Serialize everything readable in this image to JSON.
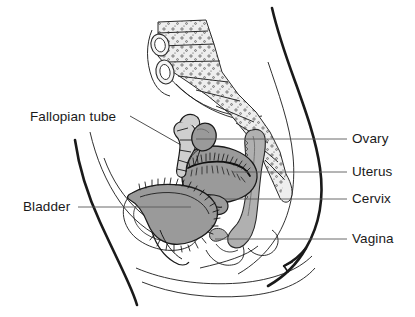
{
  "figure": {
    "background_color": "#ffffff",
    "line_color": "#1a1a1a",
    "leader_line_color": "#5a5a5a",
    "organ_fill_color": "#9a9a9a",
    "bone_fill_color": "#e8e8e8",
    "label_text_color": "#1a1a1a"
  },
  "labels": {
    "fallopian_tube": "Fallopian tube",
    "bladder": "Bladder",
    "ovary": "Ovary",
    "uterus": "Uterus",
    "cervix": "Cervix",
    "vagina": "Vagina"
  },
  "annotations": [
    {
      "id": "fallopian-tube",
      "text": "Fallopian tube",
      "side": "left",
      "label_x": 30,
      "label_y": 110,
      "leader_from_x": 130,
      "leader_from_y": 116,
      "leader_to_x": 181,
      "leader_to_y": 145
    },
    {
      "id": "bladder",
      "text": "Bladder",
      "side": "left",
      "label_x": 23,
      "label_y": 200,
      "leader_from_x": 78,
      "leader_from_y": 207,
      "leader_to_x": 191,
      "leader_to_y": 207
    },
    {
      "id": "ovary",
      "text": "Ovary",
      "side": "right",
      "label_x": 352,
      "label_y": 132,
      "leader_from_x": 196,
      "leader_from_y": 139,
      "leader_to_x": 347,
      "leader_to_y": 139
    },
    {
      "id": "uterus",
      "text": "Uterus",
      "side": "right",
      "label_x": 352,
      "label_y": 165,
      "leader_from_x": 233,
      "leader_from_y": 172,
      "leader_to_x": 347,
      "leader_to_y": 172
    },
    {
      "id": "cervix",
      "text": "Cervix",
      "side": "right",
      "label_x": 352,
      "label_y": 192,
      "leader_from_x": 224,
      "leader_from_y": 199,
      "leader_to_x": 347,
      "leader_to_y": 199
    },
    {
      "id": "vagina",
      "text": "Vagina",
      "side": "right",
      "label_x": 352,
      "label_y": 232,
      "leader_from_x": 215,
      "leader_from_y": 239,
      "leader_to_x": 347,
      "leader_to_y": 239
    }
  ],
  "structures": [
    {
      "id": "body-outline",
      "name": "body-outline",
      "fill": "none"
    },
    {
      "id": "sacrum-spine",
      "name": "sacrum-and-lumbar-spine",
      "fill": "#e8e8e8"
    },
    {
      "id": "uterus",
      "name": "uterus",
      "fill": "#9a9a9a"
    },
    {
      "id": "bladder",
      "name": "bladder",
      "fill": "#9a9a9a"
    },
    {
      "id": "ovary",
      "name": "ovary",
      "fill": "#9a9a9a"
    },
    {
      "id": "fallopian-tube",
      "name": "fallopian-tube",
      "fill": "#cfcfcf"
    },
    {
      "id": "rectum-vagina",
      "name": "rectum-and-vaginal-canal",
      "fill": "#b5b5b5"
    },
    {
      "id": "pubic-bone",
      "name": "pubic-bone",
      "fill": "none"
    }
  ]
}
